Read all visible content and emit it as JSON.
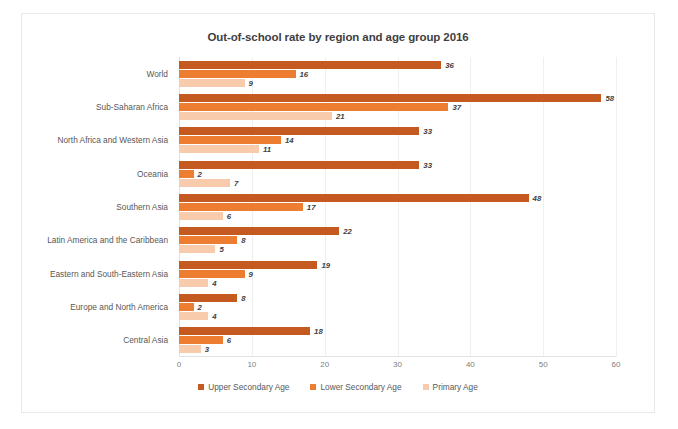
{
  "chart_data": {
    "type": "bar",
    "orientation": "horizontal",
    "title": "Out-of-school rate by region and age group 2016",
    "xlabel": "",
    "ylabel": "",
    "xlim": [
      0,
      60
    ],
    "xticks": [
      0,
      10,
      20,
      30,
      40,
      50,
      60
    ],
    "grid": true,
    "legend_position": "bottom",
    "categories": [
      "World",
      "Sub-Saharan Africa",
      "North Africa and Western Asia",
      "Oceania",
      "Southern Asia",
      "Latin America and the Caribbean",
      "Eastern and South-Eastern Asia",
      "Europe and North America",
      "Central Asia"
    ],
    "series": [
      {
        "name": "Upper Secondary Age",
        "color": "#C55A20",
        "values": [
          36,
          58,
          33,
          33,
          48,
          22,
          19,
          8,
          18
        ]
      },
      {
        "name": "Lower Secondary Age",
        "color": "#ED7D31",
        "values": [
          16,
          37,
          14,
          2,
          17,
          8,
          9,
          2,
          6
        ]
      },
      {
        "name": "Primary Age",
        "color": "#F8CBAD",
        "values": [
          9,
          21,
          11,
          7,
          6,
          5,
          4,
          4,
          3
        ]
      }
    ]
  }
}
